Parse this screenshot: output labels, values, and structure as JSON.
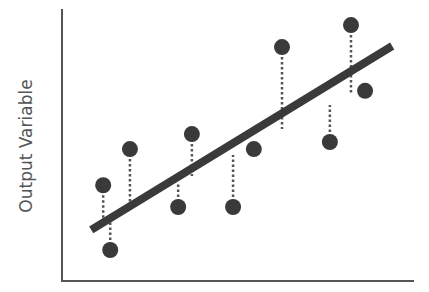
{
  "chart_data": {
    "type": "scatter",
    "title": "",
    "xlabel": "",
    "ylabel": "Output Variable",
    "grid": false,
    "legend": null,
    "xlim": [
      0,
      10
    ],
    "ylim": [
      0,
      10
    ],
    "annotations": [
      "Linear regression fit line",
      "Dotted vertical residual lines from each point to the fit line"
    ],
    "points": [
      {
        "x": 1.17,
        "y": 3.52,
        "fit": 2.19
      },
      {
        "x": 1.37,
        "y": 1.14,
        "fit": 2.3
      },
      {
        "x": 1.93,
        "y": 4.85,
        "fit": 2.74
      },
      {
        "x": 3.3,
        "y": 2.72,
        "fit": 3.62
      },
      {
        "x": 3.69,
        "y": 5.4,
        "fit": 3.86
      },
      {
        "x": 4.86,
        "y": 2.72,
        "fit": 4.63
      },
      {
        "x": 5.45,
        "y": 4.85,
        "fit": 5.0
      },
      {
        "x": 6.25,
        "y": 8.6,
        "fit": 5.59
      },
      {
        "x": 7.61,
        "y": 5.11,
        "fit": 6.47
      },
      {
        "x": 8.21,
        "y": 9.41,
        "fit": 6.88
      },
      {
        "x": 8.61,
        "y": 6.99,
        "fit": 7.13
      }
    ],
    "series": [
      {
        "name": "Observed",
        "type": "scatter",
        "x": [
          1.17,
          1.37,
          1.93,
          3.3,
          3.69,
          4.86,
          5.45,
          6.25,
          7.61,
          8.21,
          8.61
        ],
        "y": [
          3.52,
          1.14,
          4.85,
          2.72,
          5.4,
          2.72,
          4.85,
          8.6,
          5.11,
          9.41,
          6.99
        ]
      },
      {
        "name": "Regression line",
        "type": "line",
        "x": [
          0.83,
          9.38
        ],
        "y": [
          1.88,
          8.64
        ]
      }
    ]
  },
  "style": {
    "axis_color": "#555555",
    "point_color": "#3a3a3a",
    "line_color": "#3a3a3a",
    "residual_color": "#555555"
  }
}
